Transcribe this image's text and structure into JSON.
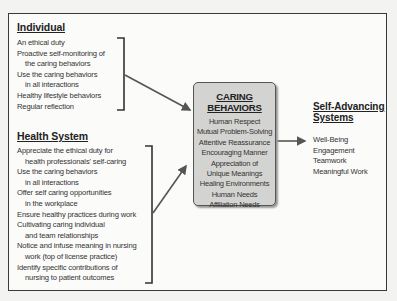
{
  "individual": {
    "title": "Individual",
    "items": [
      {
        "text": "An ethical duty",
        "indent": false
      },
      {
        "text": "Proactive self-monitoring of",
        "indent": false
      },
      {
        "text": "the caring behaviors",
        "indent": true
      },
      {
        "text": "Use the caring behaviors",
        "indent": false
      },
      {
        "text": "in all interactions",
        "indent": true
      },
      {
        "text": "Healthy lifestyle behaviors",
        "indent": false
      },
      {
        "text": "Regular reflection",
        "indent": false
      }
    ]
  },
  "health_system": {
    "title": "Health System",
    "items": [
      {
        "text": "Appreciate the ethical duty for",
        "indent": false
      },
      {
        "text": "health professionals' self-caring",
        "indent": true
      },
      {
        "text": "Use the caring behaviors",
        "indent": false
      },
      {
        "text": "in all interactions",
        "indent": true
      },
      {
        "text": "Offer self caring opportunities",
        "indent": false
      },
      {
        "text": "in the workplace",
        "indent": true
      },
      {
        "text": "Ensure healthy practices during work",
        "indent": false
      },
      {
        "text": "Cultivating caring individual",
        "indent": false
      },
      {
        "text": "and team relationships",
        "indent": true
      },
      {
        "text": "Notice and infuse meaning in nursing",
        "indent": false
      },
      {
        "text": "work (top of license practice)",
        "indent": true
      },
      {
        "text": "Identify specific contributions of",
        "indent": false
      },
      {
        "text": "nursing to patient outcomes",
        "indent": true
      }
    ]
  },
  "caring_behaviors": {
    "title": "CARING BEHAVIORS",
    "items": [
      "Human Respect",
      "Mutual Problem-Solving",
      "Attentive Reassurance",
      "Encouraging Manner",
      "Appreciation of",
      "Unique Meanings",
      "Healing Environments",
      "Human Needs",
      "Affiliation Needs"
    ]
  },
  "self_advancing": {
    "title_line1": "Self-Advancing",
    "title_line2": "Systems",
    "items": [
      "Well-Being",
      "Engagement",
      "Teamwork",
      "Meaningful Work"
    ]
  },
  "colors": {
    "frame_border": "#3a3a3a",
    "box_fill": "#d3d3d1",
    "arrow": "#555555"
  }
}
